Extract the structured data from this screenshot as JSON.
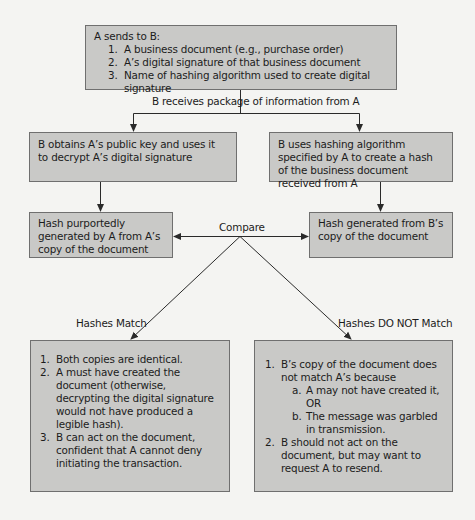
{
  "title_box": {
    "heading": "A sends to B:",
    "items": [
      {
        "num": "1.",
        "text": "A business document (e.g., purchase order)"
      },
      {
        "num": "2.",
        "text": "A’s digital signature of that business document"
      },
      {
        "num": "3.",
        "text": "Name of hashing algorithm used to create digital signature"
      }
    ]
  },
  "receive_label": "B receives package of information from A",
  "left_step": "B obtains A’s public key and uses it to decrypt A’s digital signature",
  "right_step": "B uses hashing algorithm specified by A to create a hash of the business document received from A",
  "left_hash": "Hash purportedly generated by A from A’s copy of the document",
  "right_hash": "Hash generated from B’s copy of the document",
  "compare_label": "Compare",
  "match_label": "Hashes Match",
  "nomatch_label": "Hashes DO NOT Match",
  "match_box": {
    "items": [
      {
        "num": "1.",
        "text": "Both copies are identical."
      },
      {
        "num": "2.",
        "text": "A must have created the document (otherwise, decrypting the digital signature would not have produced a legible hash)."
      },
      {
        "num": "3.",
        "text": "B can act on the document, confident that A cannot deny initiating the transaction."
      }
    ]
  },
  "nomatch_box": {
    "items": [
      {
        "num": "1.",
        "text": "B’s copy of the document does not match A’s because"
      },
      {
        "num": "2.",
        "text": "B should not act on the document, but may want to request A to resend."
      }
    ],
    "subitems": [
      {
        "num": "a.",
        "text": "A may not have created it, OR"
      },
      {
        "num": "b.",
        "text": "The message was garbled in transmission."
      }
    ]
  },
  "colors": {
    "box_fill": "#c9c9c7",
    "box_border": "#6f6f6f",
    "line": "#2a2a2a",
    "background": "#f4f4f2"
  }
}
